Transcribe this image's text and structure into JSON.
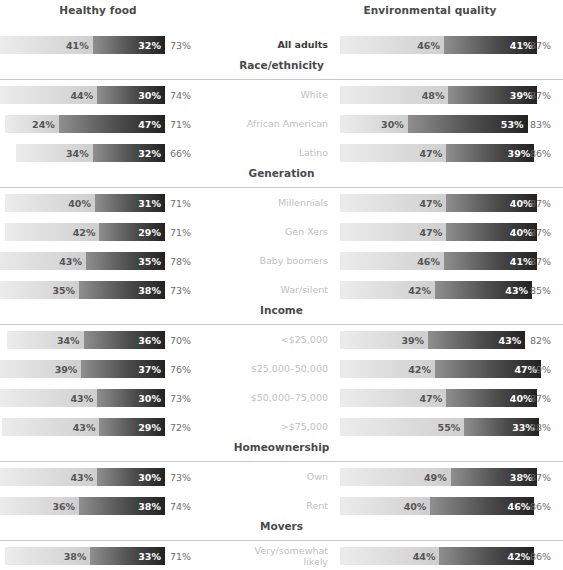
{
  "panels": {
    "left": {
      "title": "Healthy food"
    },
    "right": {
      "title": "Environmental quality"
    }
  },
  "chart_data": {
    "type": "bar",
    "subtype": "stacked-horizontal-diverging-pair",
    "title": "",
    "xlabel": "",
    "ylabel": "",
    "grid": false,
    "legend_position": "none",
    "panels": [
      "Healthy food",
      "Environmental quality"
    ],
    "series": [
      {
        "name": "Somewhat important",
        "color": "#dcdcdc"
      },
      {
        "name": "Very important",
        "color": "#4d4d4d"
      }
    ],
    "sections": [
      {
        "label": "",
        "has_header": false,
        "rows": [
          {
            "label": "All adults",
            "highlight": true,
            "left": {
              "light": 41,
              "dark": 32,
              "total": 73
            },
            "right": {
              "light": 46,
              "dark": 41,
              "total": 87
            }
          }
        ]
      },
      {
        "label": "Race/ethnicity",
        "has_header": true,
        "rows": [
          {
            "label": "White",
            "highlight": false,
            "left": {
              "light": 44,
              "dark": 30,
              "total": 74
            },
            "right": {
              "light": 48,
              "dark": 39,
              "total": 87
            }
          },
          {
            "label": "African American",
            "highlight": false,
            "left": {
              "light": 24,
              "dark": 47,
              "total": 71
            },
            "right": {
              "light": 30,
              "dark": 53,
              "total": 83
            }
          },
          {
            "label": "Latino",
            "highlight": false,
            "left": {
              "light": 34,
              "dark": 32,
              "total": 66
            },
            "right": {
              "light": 47,
              "dark": 39,
              "total": 86
            }
          }
        ]
      },
      {
        "label": "Generation",
        "has_header": true,
        "rows": [
          {
            "label": "Millennials",
            "highlight": false,
            "left": {
              "light": 40,
              "dark": 31,
              "total": 71
            },
            "right": {
              "light": 47,
              "dark": 40,
              "total": 87
            }
          },
          {
            "label": "Gen Xers",
            "highlight": false,
            "left": {
              "light": 42,
              "dark": 29,
              "total": 71
            },
            "right": {
              "light": 47,
              "dark": 40,
              "total": 87
            }
          },
          {
            "label": "Baby boomers",
            "highlight": false,
            "left": {
              "light": 43,
              "dark": 35,
              "total": 78
            },
            "right": {
              "light": 46,
              "dark": 41,
              "total": 87
            }
          },
          {
            "label": "War/silent",
            "highlight": false,
            "left": {
              "light": 35,
              "dark": 38,
              "total": 73
            },
            "right": {
              "light": 42,
              "dark": 43,
              "total": 85
            }
          }
        ]
      },
      {
        "label": "Income",
        "has_header": true,
        "rows": [
          {
            "label": "<$25,000",
            "highlight": false,
            "left": {
              "light": 34,
              "dark": 36,
              "total": 70
            },
            "right": {
              "light": 39,
              "dark": 43,
              "total": 82
            }
          },
          {
            "label": "$25,000–50,000",
            "highlight": false,
            "left": {
              "light": 39,
              "dark": 37,
              "total": 76
            },
            "right": {
              "light": 42,
              "dark": 47,
              "total": 89
            }
          },
          {
            "label": "$50,000–75,000",
            "highlight": false,
            "left": {
              "light": 43,
              "dark": 30,
              "total": 73
            },
            "right": {
              "light": 47,
              "dark": 40,
              "total": 87
            }
          },
          {
            "label": ">$75,000",
            "highlight": false,
            "left": {
              "light": 43,
              "dark": 29,
              "total": 72
            },
            "right": {
              "light": 55,
              "dark": 33,
              "total": 88
            }
          }
        ]
      },
      {
        "label": "Homeownership",
        "has_header": true,
        "rows": [
          {
            "label": "Own",
            "highlight": false,
            "left": {
              "light": 43,
              "dark": 30,
              "total": 73
            },
            "right": {
              "light": 49,
              "dark": 38,
              "total": 87
            }
          },
          {
            "label": "Rent",
            "highlight": false,
            "left": {
              "light": 36,
              "dark": 38,
              "total": 74
            },
            "right": {
              "light": 40,
              "dark": 46,
              "total": 86
            }
          }
        ]
      },
      {
        "label": "Movers",
        "has_header": true,
        "rows": [
          {
            "label": "Very/somewhat\nlikely",
            "highlight": false,
            "left": {
              "light": 38,
              "dark": 33,
              "total": 71
            },
            "right": {
              "light": 44,
              "dark": 42,
              "total": 86
            }
          }
        ]
      }
    ]
  }
}
